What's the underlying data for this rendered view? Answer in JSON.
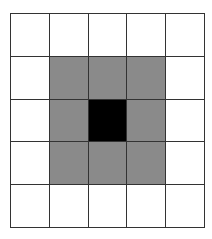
{
  "grid": {
    "rows": 5,
    "cols": 5,
    "colors": {
      "empty": "#ffffff",
      "neighbor": "#8a8a8a",
      "center": "#000000",
      "line": "#333333"
    },
    "cells": [
      [
        "empty",
        "empty",
        "empty",
        "empty",
        "empty"
      ],
      [
        "empty",
        "neighbor",
        "neighbor",
        "neighbor",
        "empty"
      ],
      [
        "empty",
        "neighbor",
        "center",
        "neighbor",
        "empty"
      ],
      [
        "empty",
        "neighbor",
        "neighbor",
        "neighbor",
        "empty"
      ],
      [
        "empty",
        "empty",
        "empty",
        "empty",
        "empty"
      ]
    ]
  }
}
